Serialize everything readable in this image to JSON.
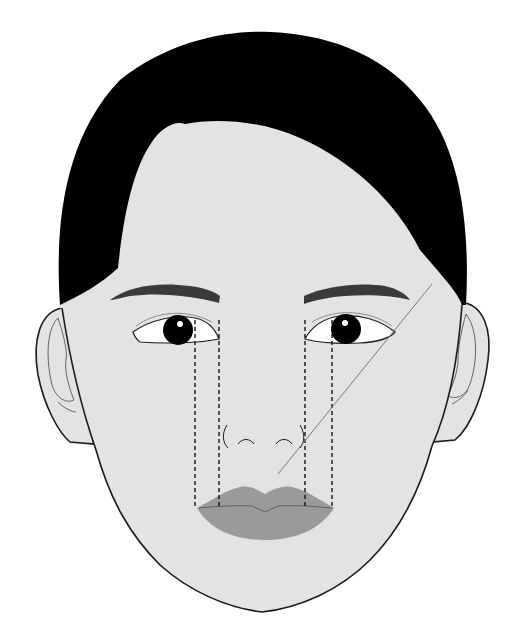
{
  "figure": {
    "colors": {
      "background": "#ffffff",
      "skin": "#e3e3e3",
      "hair": "#000000",
      "outline": "#1a1a1a",
      "lips": "#9a9a9a",
      "lip_line": "#5e5e5e",
      "eyebrow": "#3a3a3a",
      "guide_line": "#777777",
      "dashed_guide": "#111111",
      "eye_white": "#ffffff",
      "iris": "#000000"
    },
    "guides": {
      "dashed_vertical_x": [
        195,
        219,
        305,
        332
      ],
      "dashed_top_y": 320,
      "dashed_bottom_y": 508,
      "diagonal": {
        "x1": 432,
        "y1": 284,
        "x2": 278,
        "y2": 474
      }
    }
  }
}
